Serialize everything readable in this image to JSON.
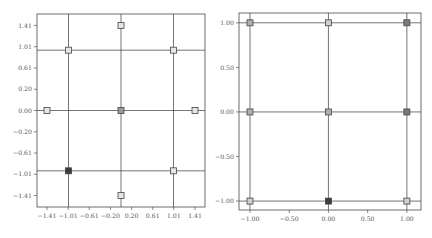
{
  "chart_data": [
    {
      "type": "scatter",
      "title": "",
      "xlabel": "",
      "ylabel": "",
      "xlim": [
        -1.6,
        1.6
      ],
      "ylim": [
        -1.6,
        1.6
      ],
      "grid": false,
      "reference_lines": {
        "x": [
          -1,
          0,
          1
        ],
        "y": [
          -1,
          0,
          1
        ]
      },
      "xticks": [
        -1.41,
        -1.0071,
        -0.6043,
        -0.2014,
        0.2014,
        0.6043,
        1.0071,
        1.41
      ],
      "xtick_labels": [
        "-1.41",
        "-1.01",
        "-0.61",
        "-0.20",
        "0.20",
        "0.61",
        "1.01",
        "1.41"
      ],
      "yticks": [
        1.41,
        1.0575,
        0.705,
        0.3525,
        0.0,
        -0.3525,
        -0.705,
        -1.0575,
        -1.41
      ],
      "ytick_labels": [
        "1.41",
        "1.01",
        "0.61",
        "0.20",
        "0.00",
        "-0.20",
        "-0.61",
        "-1.01",
        "-1.41"
      ],
      "points": [
        {
          "x": -1.41,
          "y": 0.0,
          "fill": "#e6e6e6"
        },
        {
          "x": -1.0,
          "y": 1.0,
          "fill": "#e6e6e6"
        },
        {
          "x": 0.0,
          "y": 1.41,
          "fill": "#e6e6e6"
        },
        {
          "x": 1.0,
          "y": 1.0,
          "fill": "#e6e6e6"
        },
        {
          "x": 1.41,
          "y": 0.0,
          "fill": "#e6e6e6"
        },
        {
          "x": 1.0,
          "y": -1.0,
          "fill": "#e6e6e6"
        },
        {
          "x": 0.0,
          "y": -1.41,
          "fill": "#e6e6e6"
        },
        {
          "x": -1.0,
          "y": -1.0,
          "fill": "#3c3c3c"
        },
        {
          "x": 0.0,
          "y": 0.0,
          "fill": "#9a9a9a"
        }
      ]
    },
    {
      "type": "scatter",
      "title": "",
      "xlabel": "",
      "ylabel": "",
      "xlim": [
        -1.14,
        1.18
      ],
      "ylim": [
        -1.1,
        1.11
      ],
      "grid": false,
      "reference_lines": {
        "x": [
          -1,
          0,
          1
        ],
        "y": [
          -1,
          0,
          1
        ]
      },
      "xticks": [
        -1.0,
        -0.5,
        0.0,
        0.5,
        1.0
      ],
      "xtick_labels": [
        "-1.00",
        "-0.50",
        "0.00",
        "0.50",
        "1.00"
      ],
      "yticks": [
        1.0,
        0.5,
        0.0,
        -0.5,
        -1.0
      ],
      "ytick_labels": [
        "1.00",
        "0.50",
        "0.00",
        "-0.50",
        "-1.00"
      ],
      "points": [
        {
          "x": -1.0,
          "y": 1.0,
          "fill": "#b0b0b0"
        },
        {
          "x": 0.0,
          "y": 1.0,
          "fill": "#d0d0d0"
        },
        {
          "x": 1.0,
          "y": 1.0,
          "fill": "#7a7a7a"
        },
        {
          "x": -1.0,
          "y": 0.0,
          "fill": "#b0b0b0"
        },
        {
          "x": 0.0,
          "y": 0.0,
          "fill": "#b0b0b0"
        },
        {
          "x": 1.0,
          "y": 0.0,
          "fill": "#7a7a7a"
        },
        {
          "x": -1.0,
          "y": -1.0,
          "fill": "#d0d0d0"
        },
        {
          "x": 0.0,
          "y": -1.0,
          "fill": "#3c3c3c"
        },
        {
          "x": 1.0,
          "y": -1.0,
          "fill": "#d0d0d0"
        }
      ]
    }
  ]
}
